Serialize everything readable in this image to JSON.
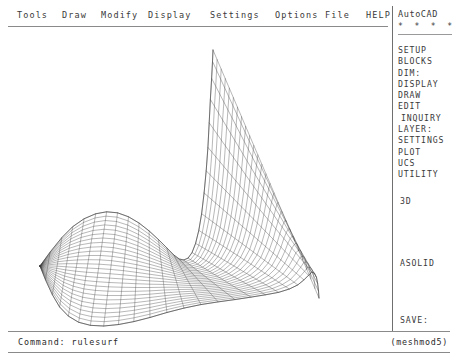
{
  "app": {
    "name": "AutoCAD",
    "background_color": "#ffffff",
    "ink_color": "#2b2b2b"
  },
  "menubar": {
    "items": [
      {
        "label": "Tools",
        "x": 17
      },
      {
        "label": "Draw",
        "x": 62
      },
      {
        "label": "Modify",
        "x": 101
      },
      {
        "label": "Display",
        "x": 148
      },
      {
        "label": "Settings",
        "x": 210
      },
      {
        "label": "Options",
        "x": 275
      },
      {
        "label": "File",
        "x": 325
      },
      {
        "label": "HELP",
        "x": 366
      }
    ]
  },
  "sidemenu": {
    "title": "AutoCAD",
    "dots": "* * * *",
    "items": [
      {
        "label": "SETUP",
        "indent": false
      },
      {
        "label": "BLOCKS",
        "indent": false
      },
      {
        "label": "DIM:",
        "indent": false
      },
      {
        "label": "DISPLAY",
        "indent": false
      },
      {
        "label": "DRAW",
        "indent": false
      },
      {
        "label": "EDIT",
        "indent": false
      },
      {
        "label": "INQUIRY",
        "indent": true
      },
      {
        "label": "LAYER:",
        "indent": false
      },
      {
        "label": "SETTINGS",
        "indent": false
      },
      {
        "label": "PLOT",
        "indent": false
      },
      {
        "label": "UCS",
        "indent": false
      },
      {
        "label": "UTILITY",
        "indent": false
      }
    ],
    "group_3d": "3D",
    "group_asolid": "ASOLID",
    "group_save": "SAVE:"
  },
  "commandline": {
    "prompt_text": "Command: rulesurf",
    "status_text": "(meshmod5)"
  },
  "drawing": {
    "name": "rulesurf-mesh-surface",
    "line_color": "#3c3c3c",
    "rules": 28,
    "segments": 26,
    "curve_a": [
      [
        40,
        238
      ],
      [
        58,
        214
      ],
      [
        76,
        196
      ],
      [
        95,
        186
      ],
      [
        113,
        184
      ],
      [
        131,
        190
      ],
      [
        148,
        202
      ],
      [
        163,
        216
      ],
      [
        175,
        228
      ],
      [
        183,
        232
      ],
      [
        190,
        228
      ],
      [
        196,
        214
      ],
      [
        201,
        190
      ],
      [
        205,
        156
      ],
      [
        208,
        118
      ],
      [
        210,
        78
      ],
      [
        212,
        44
      ],
      [
        213,
        22
      ]
    ],
    "curve_b": [
      [
        40,
        238
      ],
      [
        50,
        262
      ],
      [
        62,
        282
      ],
      [
        78,
        294
      ],
      [
        98,
        298
      ],
      [
        122,
        296
      ],
      [
        148,
        290
      ],
      [
        176,
        282
      ],
      [
        204,
        276
      ],
      [
        232,
        272
      ],
      [
        258,
        268
      ],
      [
        280,
        264
      ],
      [
        296,
        258
      ],
      [
        306,
        250
      ],
      [
        312,
        244
      ],
      [
        316,
        248
      ],
      [
        318,
        258
      ],
      [
        319,
        270
      ]
    ]
  }
}
